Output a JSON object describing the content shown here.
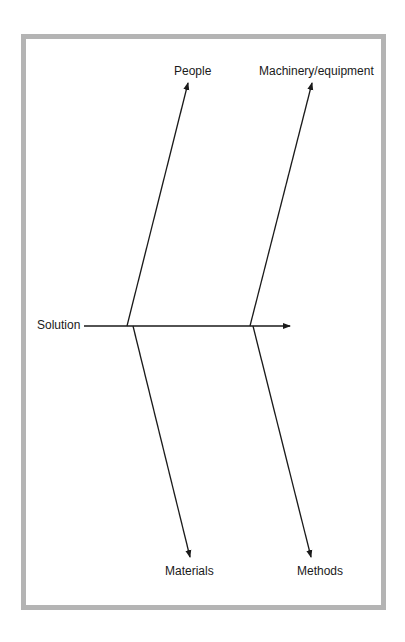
{
  "diagram": {
    "type": "fishbone",
    "head_label": "Solution",
    "categories": [
      {
        "label": "People",
        "position": "top-left"
      },
      {
        "label": "Machinery/equipment",
        "position": "top-right"
      },
      {
        "label": "Materials",
        "position": "bottom-left"
      },
      {
        "label": "Methods",
        "position": "bottom-right"
      }
    ],
    "colors": {
      "frame": "#b4b4b4",
      "lines": "#1a1a1a",
      "background": "#ffffff"
    }
  }
}
